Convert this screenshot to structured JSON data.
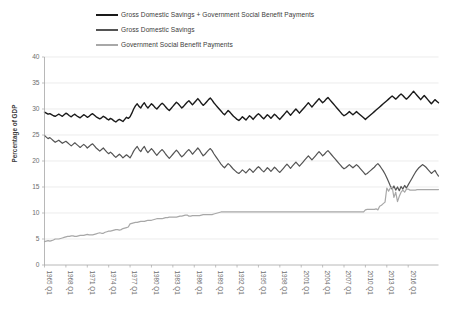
{
  "chart_data": {
    "type": "line",
    "title": "",
    "xlabel": "",
    "ylabel": "Percentage of GDP",
    "ylim": [
      0,
      40
    ],
    "ytick_step": 5,
    "yticks": [
      "0",
      "5",
      "10",
      "15",
      "20",
      "25",
      "30",
      "35",
      "40"
    ],
    "grid": true,
    "legend_position": "top",
    "x_start": "1965 Q1",
    "x_end": "2017 Q4",
    "xticks": [
      "1965 Q1",
      "1968 Q1",
      "1971 Q1",
      "1974 Q1",
      "1977 Q1",
      "1980 Q1",
      "1983 Q1",
      "1986 Q1",
      "1989 Q1",
      "1992 Q1",
      "1995 Q1",
      "1998 Q1",
      "2001 Q1",
      "2004 Q1",
      "2007 Q1",
      "2010 Q1",
      "2013 Q1",
      "2016 Q1"
    ],
    "series": [
      {
        "name": "Gross Domestic Savings + Government Social Benefit Payments",
        "color": "#1a1a1a",
        "width": 1.4,
        "values": [
          29.4,
          29.2,
          29.0,
          29.1,
          28.9,
          28.7,
          28.6,
          28.8,
          29.0,
          28.8,
          28.6,
          28.9,
          29.2,
          29.0,
          28.7,
          28.5,
          28.8,
          29.0,
          28.7,
          28.5,
          28.3,
          28.6,
          28.9,
          28.7,
          28.4,
          28.6,
          28.9,
          29.1,
          28.8,
          28.5,
          28.3,
          28.1,
          28.3,
          28.6,
          28.4,
          28.1,
          27.9,
          28.2,
          28.0,
          27.7,
          27.5,
          27.8,
          28.0,
          27.8,
          27.6,
          28.0,
          28.4,
          28.2,
          28.5,
          29.2,
          30.0,
          30.6,
          31.0,
          30.5,
          30.2,
          30.8,
          31.2,
          30.6,
          30.2,
          30.6,
          31.0,
          30.7,
          30.3,
          30.0,
          30.4,
          30.8,
          31.1,
          30.8,
          30.4,
          30.0,
          29.7,
          30.1,
          30.5,
          30.9,
          31.3,
          31.0,
          30.6,
          30.2,
          30.5,
          30.9,
          31.3,
          31.6,
          31.2,
          30.8,
          31.2,
          31.6,
          32.0,
          31.6,
          31.1,
          30.7,
          31.0,
          31.4,
          31.8,
          32.1,
          31.7,
          31.2,
          30.8,
          30.4,
          30.0,
          29.6,
          29.2,
          28.9,
          29.3,
          29.7,
          29.4,
          29.0,
          28.6,
          28.3,
          28.0,
          27.8,
          28.1,
          28.5,
          28.2,
          27.9,
          28.3,
          28.7,
          28.4,
          28.0,
          28.4,
          28.8,
          29.1,
          28.8,
          28.4,
          28.1,
          28.5,
          28.9,
          28.6,
          28.2,
          28.6,
          29.0,
          28.7,
          28.3,
          28.0,
          28.4,
          28.8,
          29.2,
          29.6,
          29.2,
          28.8,
          29.2,
          29.6,
          30.0,
          29.6,
          29.2,
          29.6,
          30.0,
          30.4,
          30.8,
          31.2,
          30.8,
          30.4,
          30.8,
          31.2,
          31.6,
          32.0,
          31.6,
          31.2,
          31.5,
          31.9,
          32.2,
          31.8,
          31.4,
          31.0,
          30.6,
          30.2,
          29.8,
          29.4,
          29.0,
          28.7,
          28.9,
          29.2,
          29.5,
          29.2,
          28.9,
          29.2,
          29.5,
          29.2,
          28.9,
          28.6,
          28.3,
          28.0,
          28.3,
          28.6,
          28.9,
          29.2,
          29.5,
          29.8,
          30.1,
          30.4,
          30.7,
          31.0,
          31.3,
          31.6,
          31.9,
          32.2,
          32.5,
          32.2,
          31.9,
          32.2,
          32.6,
          32.9,
          32.6,
          32.2,
          31.9,
          32.2,
          32.6,
          33.0,
          33.4,
          33.0,
          32.6,
          32.2,
          31.8,
          32.2,
          32.6,
          32.2,
          31.8,
          31.4,
          31.0,
          31.4,
          31.8,
          31.5,
          31.2
        ]
      },
      {
        "name": "Gross Domestic Savings",
        "color": "#545454",
        "width": 1.2,
        "values": [
          24.9,
          24.6,
          24.3,
          24.5,
          24.2,
          23.9,
          23.6,
          23.8,
          24.0,
          23.7,
          23.4,
          23.6,
          23.8,
          23.5,
          23.2,
          22.9,
          23.2,
          23.5,
          23.2,
          22.9,
          22.6,
          22.9,
          23.2,
          22.9,
          22.5,
          22.8,
          23.1,
          23.3,
          22.9,
          22.5,
          22.2,
          21.9,
          22.2,
          22.5,
          22.1,
          21.7,
          21.4,
          21.7,
          21.4,
          21.0,
          20.7,
          21.0,
          21.3,
          21.0,
          20.6,
          20.9,
          21.2,
          20.9,
          20.6,
          21.2,
          21.9,
          22.4,
          22.8,
          22.2,
          21.8,
          22.4,
          22.8,
          22.1,
          21.6,
          22.0,
          22.4,
          22.0,
          21.5,
          21.1,
          21.5,
          21.9,
          22.2,
          21.8,
          21.3,
          20.9,
          20.5,
          20.9,
          21.3,
          21.7,
          22.1,
          21.7,
          21.2,
          20.8,
          21.1,
          21.5,
          21.9,
          22.2,
          21.8,
          21.3,
          21.7,
          22.1,
          22.5,
          22.1,
          21.5,
          21.0,
          21.3,
          21.7,
          22.1,
          22.4,
          22.0,
          21.4,
          20.9,
          20.4,
          19.9,
          19.4,
          19.0,
          18.7,
          19.1,
          19.5,
          19.2,
          18.8,
          18.4,
          18.1,
          17.8,
          17.6,
          17.9,
          18.3,
          18.0,
          17.7,
          18.1,
          18.5,
          18.2,
          17.8,
          18.2,
          18.6,
          18.9,
          18.6,
          18.2,
          17.9,
          18.3,
          18.7,
          18.4,
          18.0,
          18.4,
          18.8,
          18.5,
          18.1,
          17.8,
          18.2,
          18.6,
          19.0,
          19.4,
          19.0,
          18.6,
          19.0,
          19.4,
          19.8,
          19.4,
          19.0,
          19.4,
          19.8,
          20.2,
          20.6,
          21.0,
          20.6,
          20.2,
          20.6,
          21.0,
          21.4,
          21.8,
          21.4,
          21.0,
          21.3,
          21.7,
          22.0,
          21.6,
          21.2,
          20.8,
          20.4,
          20.0,
          19.6,
          19.2,
          18.8,
          18.5,
          18.7,
          19.0,
          19.3,
          19.0,
          18.7,
          19.0,
          19.3,
          19.0,
          18.6,
          18.2,
          17.8,
          17.4,
          17.6,
          17.9,
          18.2,
          18.5,
          18.8,
          19.2,
          19.5,
          19.1,
          18.6,
          18.1,
          17.5,
          16.8,
          16.0,
          15.2,
          14.6,
          15.2,
          14.4,
          15.0,
          14.3,
          15.1,
          14.6,
          15.3,
          14.8,
          15.4,
          16.0,
          16.6,
          17.2,
          17.8,
          18.3,
          18.7,
          19.0,
          19.3,
          19.1,
          18.8,
          18.4,
          18.0,
          17.6,
          17.9,
          18.2,
          17.6,
          17.1
        ]
      },
      {
        "name": "Government Social Benefit Payments",
        "color": "#a8a8a8",
        "width": 1.2,
        "values": [
          4.5,
          4.6,
          4.7,
          4.6,
          4.7,
          4.8,
          5.0,
          5.0,
          5.0,
          5.1,
          5.2,
          5.3,
          5.4,
          5.5,
          5.5,
          5.6,
          5.6,
          5.5,
          5.5,
          5.6,
          5.7,
          5.7,
          5.7,
          5.8,
          5.9,
          5.8,
          5.8,
          5.8,
          5.9,
          6.0,
          6.1,
          6.2,
          6.1,
          6.1,
          6.3,
          6.4,
          6.5,
          6.5,
          6.6,
          6.7,
          6.8,
          6.8,
          6.7,
          6.8,
          7.0,
          7.1,
          7.2,
          7.3,
          7.9,
          8.0,
          8.1,
          8.2,
          8.2,
          8.3,
          8.4,
          8.4,
          8.4,
          8.5,
          8.6,
          8.6,
          8.6,
          8.7,
          8.8,
          8.9,
          8.9,
          8.9,
          8.9,
          9.0,
          9.1,
          9.1,
          9.2,
          9.2,
          9.2,
          9.2,
          9.2,
          9.3,
          9.4,
          9.4,
          9.5,
          9.6,
          9.6,
          9.4,
          9.4,
          9.5,
          9.5,
          9.5,
          9.5,
          9.5,
          9.6,
          9.7,
          9.7,
          9.7,
          9.7,
          9.7,
          9.7,
          9.8,
          9.9,
          10.0,
          10.1,
          10.2,
          10.2,
          10.2,
          10.2,
          10.2,
          10.2,
          10.2,
          10.2,
          10.2,
          10.2,
          10.2,
          10.2,
          10.2,
          10.2,
          10.2,
          10.2,
          10.2,
          10.2,
          10.2,
          10.2,
          10.2,
          10.2,
          10.2,
          10.2,
          10.2,
          10.2,
          10.2,
          10.2,
          10.2,
          10.2,
          10.2,
          10.2,
          10.2,
          10.2,
          10.2,
          10.2,
          10.2,
          10.2,
          10.2,
          10.2,
          10.2,
          10.2,
          10.2,
          10.2,
          10.2,
          10.2,
          10.2,
          10.2,
          10.2,
          10.2,
          10.2,
          10.2,
          10.2,
          10.2,
          10.2,
          10.2,
          10.2,
          10.2,
          10.2,
          10.2,
          10.2,
          10.2,
          10.2,
          10.2,
          10.2,
          10.2,
          10.2,
          10.2,
          10.2,
          10.2,
          10.2,
          10.2,
          10.2,
          10.2,
          10.2,
          10.2,
          10.2,
          10.2,
          10.2,
          10.2,
          10.2,
          10.6,
          10.7,
          10.7,
          10.7,
          10.7,
          10.7,
          10.8,
          10.6,
          11.3,
          11.5,
          11.8,
          12.1,
          14.8,
          14.2,
          14.8,
          15.0,
          13.0,
          14.0,
          12.2,
          13.2,
          14.0,
          14.4,
          14.0,
          14.6,
          14.6,
          14.4,
          14.4,
          14.4,
          14.4,
          14.5,
          14.5,
          14.5,
          14.5,
          14.5,
          14.5,
          14.5,
          14.5,
          14.5,
          14.5,
          14.5,
          14.5,
          14.5
        ]
      }
    ]
  },
  "legend": {
    "items": [
      {
        "label": "Gross Domestic Savings + Government Social Benefit Payments",
        "color": "#1a1a1a"
      },
      {
        "label": "Gross Domestic Savings",
        "color": "#545454"
      },
      {
        "label": "Government Social Benefit Payments",
        "color": "#a8a8a8"
      }
    ]
  },
  "axes": {
    "y_title": "Percentage of GDP"
  }
}
